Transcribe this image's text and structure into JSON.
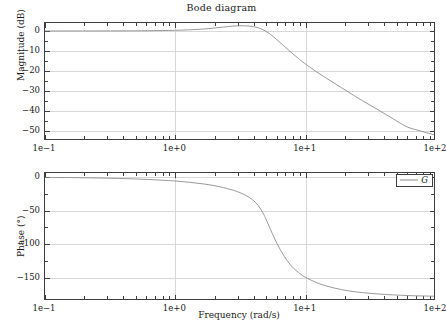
{
  "figure": {
    "title": "Bode diagram",
    "background": "#ffffff",
    "line_color": "#8d8d8d",
    "frame_color": "#3d3d3d",
    "grid_color": "#d8d8d8"
  },
  "legend": {
    "position": "top-right of phase axes",
    "entries": [
      {
        "label": "G",
        "color": "#8d8d8d"
      }
    ]
  },
  "axis_titles": {
    "x": "Frequency (rad/s)",
    "y_magnitude": "Magnitude (dB)",
    "y_phase": "Phase (°)"
  },
  "xticks": {
    "labels": [
      "1e−1",
      "1e+0",
      "1e+1",
      "1e+2"
    ],
    "values": [
      0.1,
      1,
      10,
      100
    ]
  },
  "yticks_magnitude": {
    "labels": [
      "0",
      "−10",
      "−20",
      "−30",
      "−40",
      "−50"
    ],
    "values": [
      0,
      -10,
      -20,
      -30,
      -40,
      -50
    ]
  },
  "yticks_phase": {
    "labels": [
      "0",
      "−50",
      "−100",
      "−150"
    ],
    "values": [
      0,
      -50,
      -100,
      -150
    ]
  },
  "chart_data": [
    {
      "type": "line",
      "title": "Bode diagram",
      "subtitle": "Magnitude",
      "xlabel": "",
      "ylabel": "Magnitude (dB)",
      "xscale": "log",
      "xlim": [
        0.1,
        100
      ],
      "ylim": [
        -55,
        4
      ],
      "grid": true,
      "legend": [
        "G"
      ],
      "series": [
        {
          "name": "G",
          "color": "#8d8d8d",
          "x": [
            0.1,
            0.13,
            0.17,
            0.22,
            0.28,
            0.37,
            0.48,
            0.62,
            0.8,
            1.0,
            1.3,
            1.7,
            2.2,
            2.8,
            3.2,
            3.6,
            4.0,
            4.3,
            4.6,
            5.0,
            5.4,
            5.8,
            6.3,
            7.0,
            8.0,
            9.0,
            10.0,
            13.0,
            17.0,
            22.0,
            28.0,
            37.0,
            48.0,
            62.0,
            80.0,
            100.0
          ],
          "values": [
            0.0,
            0.0,
            0.01,
            0.01,
            0.02,
            0.04,
            0.07,
            0.12,
            0.2,
            0.33,
            0.57,
            1.0,
            1.73,
            2.4,
            2.6,
            2.55,
            2.2,
            1.8,
            1.2,
            0.0,
            -1.4,
            -3.0,
            -5.0,
            -7.7,
            -11.0,
            -13.8,
            -16.2,
            -21.4,
            -26.2,
            -30.8,
            -35.0,
            -39.6,
            -44.0,
            -48.2,
            -50.4,
            -52.2
          ]
        }
      ]
    },
    {
      "type": "line",
      "title": "",
      "subtitle": "Phase",
      "xlabel": "Frequency (rad/s)",
      "ylabel": "Phase (°)",
      "xscale": "log",
      "xlim": [
        0.1,
        100
      ],
      "ylim": [
        -185,
        6
      ],
      "grid": true,
      "legend": [
        "G"
      ],
      "series": [
        {
          "name": "G",
          "color": "#8d8d8d",
          "x": [
            0.1,
            0.13,
            0.17,
            0.22,
            0.28,
            0.37,
            0.48,
            0.62,
            0.8,
            1.0,
            1.3,
            1.7,
            2.2,
            2.8,
            3.2,
            3.6,
            4.0,
            4.4,
            4.8,
            5.0,
            5.3,
            5.7,
            6.2,
            7.0,
            8.0,
            9.0,
            10.0,
            13.0,
            17.0,
            22.0,
            28.0,
            37.0,
            48.0,
            62.0,
            80.0,
            100.0
          ],
          "values": [
            -0.6,
            -0.8,
            -1.0,
            -1.3,
            -1.6,
            -2.2,
            -2.8,
            -3.7,
            -4.8,
            -6.0,
            -7.9,
            -10.6,
            -14.4,
            -19.6,
            -23.6,
            -28.4,
            -34.4,
            -42.5,
            -54.0,
            -61.0,
            -72.0,
            -86.0,
            -101.0,
            -119.0,
            -134.0,
            -143.0,
            -149.5,
            -160.0,
            -166.5,
            -170.8,
            -173.4,
            -175.4,
            -176.8,
            -177.8,
            -178.4,
            -178.8
          ]
        }
      ]
    }
  ]
}
